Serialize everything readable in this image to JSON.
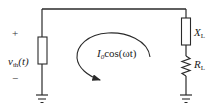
{
  "diagram": {
    "type": "circuit",
    "source": {
      "plus_label": "+",
      "minus_label": "−",
      "voltage_symbol": "v",
      "voltage_subscript": "th",
      "voltage_arg": "(t)"
    },
    "load": {
      "reactance_symbol": "X",
      "reactance_subscript": "L",
      "resistance_symbol": "R",
      "resistance_subscript": "L"
    },
    "loop_current": {
      "symbol": "I",
      "subscript": "0",
      "expression": "cos(ωt)"
    },
    "colors": {
      "wire": "#2a2a2a",
      "text": "#222222",
      "background": "#ffffff"
    }
  }
}
